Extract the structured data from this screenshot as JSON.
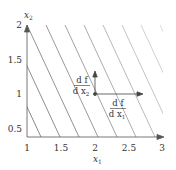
{
  "figure": {
    "x_axis": {
      "label": "x",
      "label_sub": "1",
      "ticks": [
        "1",
        "1.5",
        "2",
        "2.5",
        "3"
      ],
      "range": [
        1,
        3
      ]
    },
    "y_axis": {
      "label": "x",
      "label_sub": "2",
      "ticks": [
        "0.5",
        "1",
        "1.5",
        "2"
      ],
      "range": [
        0.4,
        2
      ]
    },
    "gradient_point": {
      "x1": 2,
      "x2": 1
    },
    "arrows": [
      {
        "name": "df-dx1",
        "numerator": "d f",
        "denominator": "d x",
        "sub": "1",
        "direction": "right"
      },
      {
        "name": "df-dx2",
        "numerator": "d f",
        "denominator": "d x",
        "sub": "2",
        "direction": "up"
      }
    ],
    "contour_lines_count": 10,
    "colors": {
      "axis": "#555555",
      "contour": "#6e6e6e",
      "text": "#333333"
    }
  }
}
